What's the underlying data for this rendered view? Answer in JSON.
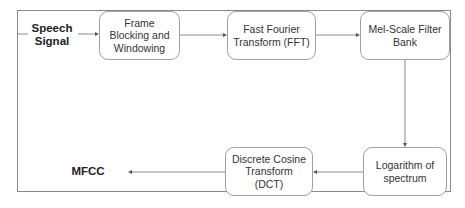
{
  "diagram": {
    "input_label": "Speech Signal",
    "output_label": "MFCC",
    "steps": [
      {
        "id": "frame-blocking",
        "label": "Frame Blocking and Windowing"
      },
      {
        "id": "fft",
        "label": "Fast Fourier Transform (FFT)"
      },
      {
        "id": "mel",
        "label": "Mel-Scale Filter Bank"
      },
      {
        "id": "log",
        "label": "Logarithm of spectrum"
      },
      {
        "id": "dct",
        "label": "Discrete Cosine Transform (DCT)"
      }
    ],
    "colors": {
      "line": "#8a8a8a",
      "box_border": "#a0a0a0",
      "text": "#333333"
    }
  }
}
